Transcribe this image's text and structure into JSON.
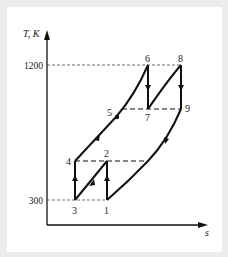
{
  "diagram": {
    "y_axis_label": "T, K",
    "x_axis_label": "s",
    "y_ticks": [
      {
        "label": "1200",
        "value": 1200
      },
      {
        "label": "300",
        "value": 300
      }
    ],
    "points": [
      {
        "label": "1"
      },
      {
        "label": "2"
      },
      {
        "label": "3"
      },
      {
        "label": "4"
      },
      {
        "label": "5"
      },
      {
        "label": "6"
      },
      {
        "label": "7"
      },
      {
        "label": "8"
      },
      {
        "label": "9"
      }
    ]
  }
}
